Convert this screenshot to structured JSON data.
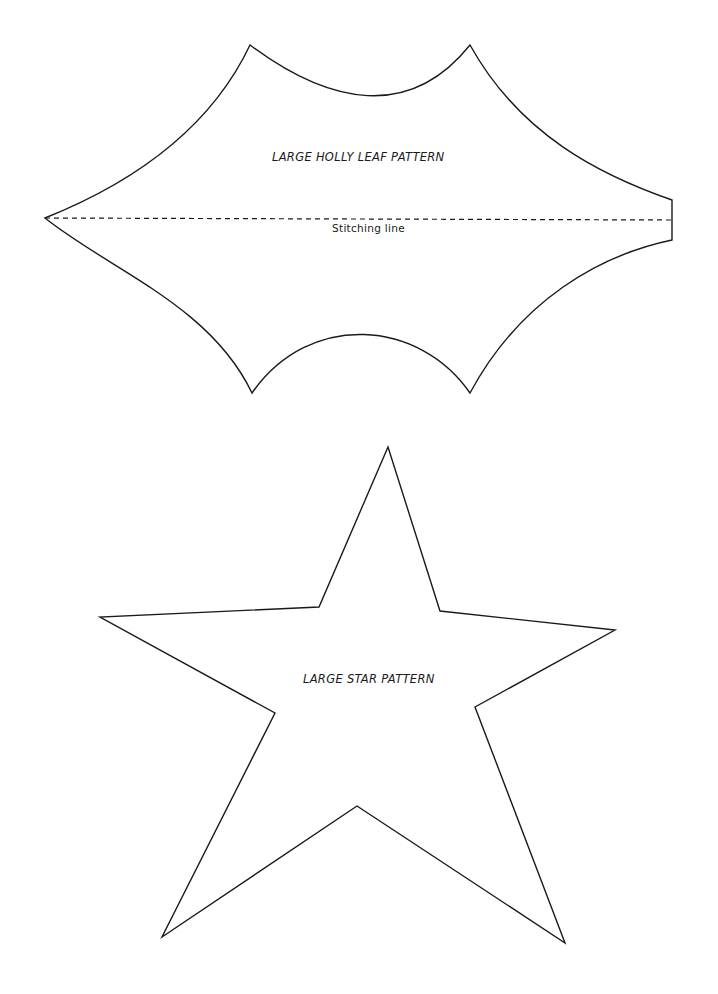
{
  "page": {
    "background": "#ffffff",
    "stroke_color": "#1a1a1a"
  },
  "holly_leaf": {
    "title": "LARGE HOLLY LEAF PATTERN",
    "stitch_label": "Stitching line",
    "shape": "holly-leaf-outline",
    "line_style_outline": "solid",
    "line_style_stitch": "dashed"
  },
  "star": {
    "title": "LARGE STAR PATTERN",
    "shape": "five-point-star-outline",
    "line_style_outline": "solid"
  }
}
